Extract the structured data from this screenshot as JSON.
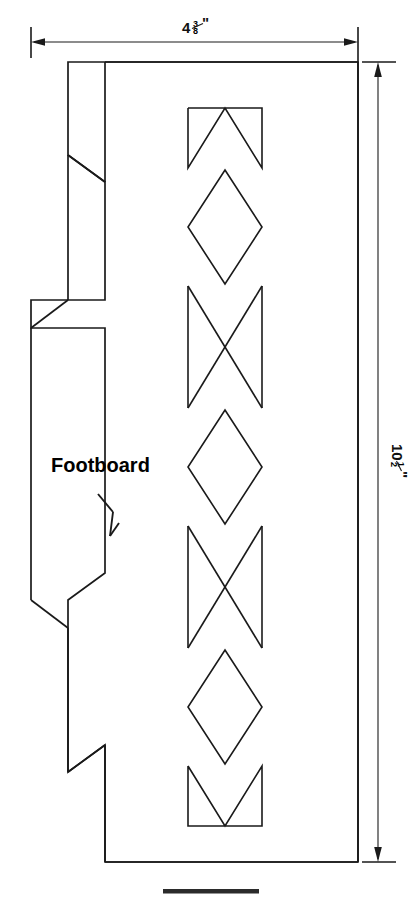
{
  "drawing": {
    "title": "Footboard pattern drawing",
    "part_label": "Footboard",
    "line_color": "#1a1a1a",
    "background_color": "#ffffff"
  },
  "dimensions": {
    "width": {
      "label": "4⅜\"",
      "whole": "4",
      "numerator": "3",
      "denominator": "8",
      "unit": "\"",
      "orientation": "horizontal",
      "position": "top"
    },
    "height": {
      "label": "10½\"",
      "whole": "10",
      "numerator": "1",
      "denominator": "2",
      "unit": "\"",
      "orientation": "vertical-rotated",
      "position": "right"
    }
  },
  "features": {
    "leader_arrow_name": "footboard-leader-arrow",
    "decorative_column": {
      "motifs": [
        "chevron-down-block",
        "diamond",
        "bowtie-x-block",
        "diamond",
        "bowtie-x-block",
        "diamond",
        "chevron-up-block"
      ],
      "count": 7
    },
    "left_profile_notches": 4,
    "bottom_bar_name": "bottom-edge-bar"
  }
}
